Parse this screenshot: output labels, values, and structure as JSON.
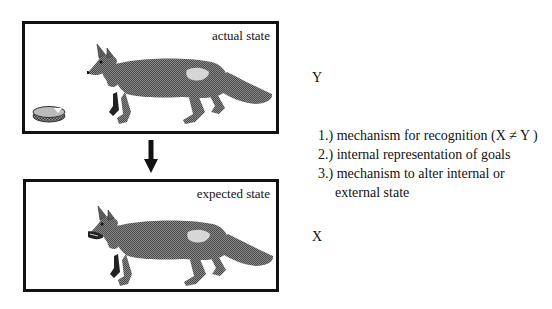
{
  "diagram": {
    "top_panel": {
      "label": "actual state",
      "variable": "Y",
      "contents": [
        "fox",
        "dish on ground"
      ]
    },
    "bottom_panel": {
      "label": "expected state",
      "variable": "X",
      "contents": [
        "fox holding dish in mouth"
      ]
    },
    "transition_arrow": "down-arrow",
    "requirements": [
      {
        "text": "1.) mechanism  for recognition  (X ≠ Y )"
      },
      {
        "text": "2.) internal representation of goals"
      },
      {
        "text": "3.) mechanism to alter internal or"
      },
      {
        "text": "external state"
      }
    ],
    "colors": {
      "line": "#111111",
      "fox_fur": "#6e6e6e",
      "fox_dark": "#222222",
      "fox_patch": "#d6d6d6",
      "background": "#ffffff"
    }
  }
}
